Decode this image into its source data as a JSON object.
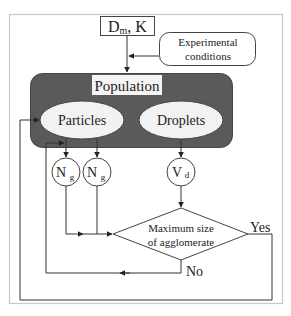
{
  "diagram": {
    "inputs": {
      "dm_k_box": {
        "main": "D",
        "sub": "m",
        "rest": ", K"
      },
      "experimental_conditions": {
        "line1": "Experimental",
        "line2": "conditions"
      }
    },
    "population": {
      "title": "Population",
      "particles": "Particles",
      "droplets": "Droplets"
    },
    "nodes": {
      "ng1": {
        "main": "N",
        "sub": "g"
      },
      "ng2": {
        "main": "N",
        "sub": "g"
      },
      "vd": {
        "main": "V",
        "sub": "d"
      }
    },
    "decision": {
      "line1": "Maximum size",
      "line2": "of agglomerate",
      "yes_label": "Yes",
      "no_label": "No"
    },
    "colors": {
      "population_fill": "#5a5a5a",
      "node_fill": "#f2f2f2",
      "line": "#333333",
      "frame": "#c8c8c8"
    }
  }
}
